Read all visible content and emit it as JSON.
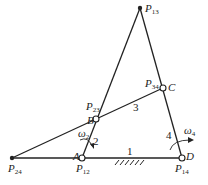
{
  "diagram": {
    "type": "four-bar linkage instant centers",
    "points": {
      "P13": {
        "label": "P",
        "sub": "13",
        "x": 140,
        "y": 8,
        "style": "dot"
      },
      "C": {
        "label": "C",
        "x": 163,
        "y": 88,
        "style": "pin"
      },
      "P34": {
        "label": "P",
        "sub": "34"
      },
      "D": {
        "label": "D",
        "x": 182,
        "y": 158,
        "style": "pin"
      },
      "P14": {
        "label": "P",
        "sub": "14"
      },
      "B": {
        "label": "B",
        "x": 96,
        "y": 119,
        "style": "pin"
      },
      "P23": {
        "label": "P",
        "sub": "23"
      },
      "A": {
        "label": "A",
        "x": 82,
        "y": 158,
        "style": "pin"
      },
      "P12": {
        "label": "P",
        "sub": "12"
      },
      "P24": {
        "label": "P",
        "sub": "24",
        "x": 12,
        "y": 158,
        "style": "dot"
      }
    },
    "links": [
      {
        "id": "1",
        "label": "1",
        "from": "A",
        "to": "D",
        "note": "ground"
      },
      {
        "id": "2",
        "label": "2",
        "from": "A",
        "to": "B"
      },
      {
        "id": "3",
        "label": "3",
        "from": "B",
        "to": "C"
      },
      {
        "id": "4",
        "label": "4",
        "from": "C",
        "to": "D"
      }
    ],
    "angular_velocities": [
      {
        "symbol": "ω",
        "sub": "2",
        "link": "2"
      },
      {
        "symbol": "ω",
        "sub": "4",
        "link": "4"
      }
    ],
    "colors": {
      "line": "#222222",
      "background": "#ffffff"
    }
  }
}
